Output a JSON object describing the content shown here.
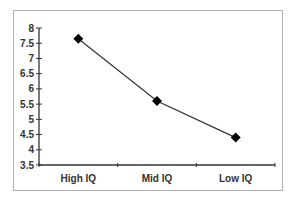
{
  "chart_data": {
    "type": "line",
    "title": "",
    "xlabel": "",
    "ylabel": "",
    "categories": [
      "High IQ",
      "Mid IQ",
      "Low IQ"
    ],
    "series": [
      {
        "name": "Series 1",
        "values": [
          7.65,
          5.6,
          4.4
        ],
        "marker": "diamond",
        "color": "#000000"
      }
    ],
    "ylim": [
      3.5,
      8
    ],
    "yticks": [
      "8",
      "7.5",
      "7",
      "6.5",
      "6",
      "5.5",
      "5",
      "4.5",
      "4",
      "3.5"
    ],
    "grid": false,
    "legend": "none"
  },
  "colors": {
    "line": "#333333",
    "marker": "#000000",
    "axis": "#333333",
    "frame": "#b0b0b0"
  }
}
